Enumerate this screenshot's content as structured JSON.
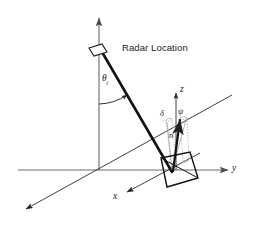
{
  "figure": {
    "background_color": "#ffffff",
    "line_color": "#1a1a1a",
    "axis_color": "#5a5a5a",
    "guide_color": "#a8a8a8"
  },
  "labels": {
    "radar_location": "Radar Location",
    "incidence_angle": "θ",
    "incidence_angle_subscript": "i",
    "axis_z": "z",
    "axis_y": "y",
    "axis_x": "x",
    "normal_vector": "n",
    "delta_angle": "δ",
    "psi_angle": "ψ"
  },
  "elements": {
    "antenna_icon": "radar-antenna-icon",
    "line_of_sight": "line-of-sight-ray",
    "facet": "scattering-facet-quadrilateral",
    "vertical_axis": "vertical-height-axis",
    "ground_axis_y": "ground-axis-y",
    "ground_axis_x": "ground-axis-x",
    "local_axis_z": "local-axis-z",
    "delta_guide": "delta-projection-guide",
    "psi_guide": "psi-projection-guide"
  }
}
